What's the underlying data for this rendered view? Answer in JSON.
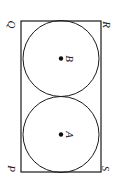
{
  "figure": {
    "type": "geometry-diagram",
    "orientation_note": "All text labels are rotated 90 degrees clockwise",
    "stroke_color": "#1a1a1a",
    "fill_color": "#ffffff",
    "background_color": "#ffffff",
    "rectangle": {
      "name": "rectangle-PQRS",
      "x": 21,
      "y": 21,
      "width": 80,
      "height": 151,
      "stroke_width": 1.2
    },
    "vertices": [
      {
        "id": "Q",
        "label": "Q",
        "corner": "top-left",
        "x": 12,
        "y": 24
      },
      {
        "id": "R",
        "label": "R",
        "corner": "top-right",
        "x": 106,
        "y": 24
      },
      {
        "id": "P",
        "label": "P",
        "corner": "bottom-left",
        "x": 12,
        "y": 168
      },
      {
        "id": "S",
        "label": "S",
        "corner": "bottom-right",
        "x": 106,
        "y": 168
      }
    ],
    "circles": [
      {
        "id": "B",
        "label": "B",
        "center_label": "B",
        "cx": 61,
        "cy": 58.5,
        "r": 38,
        "stroke_width": 1,
        "dot_radius": 2.2
      },
      {
        "id": "A",
        "label": "A",
        "center_label": "A",
        "cx": 61,
        "cy": 134.5,
        "r": 38,
        "stroke_width": 1,
        "dot_radius": 2.2
      }
    ],
    "center_labels": [
      {
        "id": "B",
        "label": "B",
        "x": 68,
        "y": 55
      },
      {
        "id": "A",
        "label": "A",
        "x": 68,
        "y": 131
      }
    ]
  }
}
